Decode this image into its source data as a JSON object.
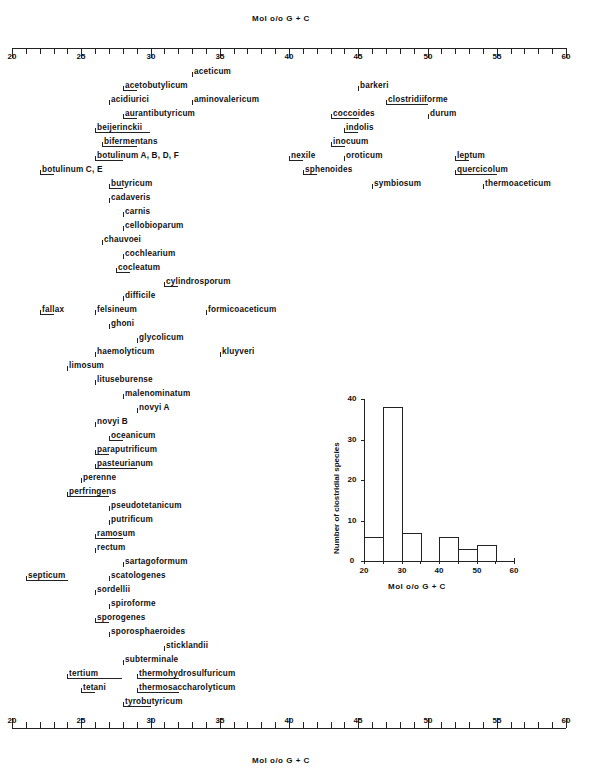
{
  "axis": {
    "title_top": "Mol o/o G + C",
    "title_bottom": "Mol o/o G + C",
    "min": 20,
    "max": 60,
    "major_ticks": [
      "20",
      "25",
      "30",
      "35",
      "40",
      "45",
      "50",
      "55",
      "60"
    ]
  },
  "chart_data": [
    {
      "type": "range",
      "title": "",
      "xlabel": "Mol % G + C",
      "xlim": [
        20,
        60
      ],
      "note": "Each species shown with start tick (and underline if range) of its G+C content",
      "species": [
        {
          "name": "aceticum",
          "min": 33,
          "max": 33
        },
        {
          "name": "acetobutylicum",
          "min": 28,
          "max": 29
        },
        {
          "name": "acidiurici",
          "min": 27,
          "max": 27
        },
        {
          "name": "aminovalericum",
          "min": 33,
          "max": 33
        },
        {
          "name": "aurantibutyricum",
          "min": 28,
          "max": 29
        },
        {
          "name": "beijerinckii",
          "min": 26,
          "max": 30
        },
        {
          "name": "bifermentans",
          "min": 26.5,
          "max": 29
        },
        {
          "name": "botulinum A,B,D,F",
          "min": 26,
          "max": 28
        },
        {
          "name": "botulinum C,E",
          "min": 22,
          "max": 23
        },
        {
          "name": "butyricum",
          "min": 27,
          "max": 28
        },
        {
          "name": "cadaveris",
          "min": 27,
          "max": 27
        },
        {
          "name": "carnis",
          "min": 28,
          "max": 28
        },
        {
          "name": "cellobioparum",
          "min": 28,
          "max": 28
        },
        {
          "name": "chauvoei",
          "min": 26.5,
          "max": 26.5
        },
        {
          "name": "cochlearium",
          "min": 28,
          "max": 28
        },
        {
          "name": "cocleatum",
          "min": 27.5,
          "max": 28.5
        },
        {
          "name": "cylindrosporum",
          "min": 31,
          "max": 32
        },
        {
          "name": "difficile",
          "min": 28,
          "max": 28
        },
        {
          "name": "fallax",
          "min": 22,
          "max": 23
        },
        {
          "name": "felsineum",
          "min": 26,
          "max": 26
        },
        {
          "name": "formicoaceticum",
          "min": 34,
          "max": 34
        },
        {
          "name": "ghoni",
          "min": 27,
          "max": 27
        },
        {
          "name": "glycolicum",
          "min": 29,
          "max": 29
        },
        {
          "name": "haemolyticum",
          "min": 26,
          "max": 26
        },
        {
          "name": "kluyveri",
          "min": 35,
          "max": 35
        },
        {
          "name": "limosum",
          "min": 24,
          "max": 24
        },
        {
          "name": "lituseburense",
          "min": 26,
          "max": 26
        },
        {
          "name": "malenominatum",
          "min": 28,
          "max": 28
        },
        {
          "name": "novyi A",
          "min": 29,
          "max": 29
        },
        {
          "name": "novyi B",
          "min": 26,
          "max": 26
        },
        {
          "name": "oceanicum",
          "min": 27,
          "max": 28
        },
        {
          "name": "paraputrificum",
          "min": 26,
          "max": 27
        },
        {
          "name": "pasteurianum",
          "min": 26,
          "max": 29
        },
        {
          "name": "perenne",
          "min": 25,
          "max": 25
        },
        {
          "name": "perfringens",
          "min": 24,
          "max": 27
        },
        {
          "name": "pseudotetanicum",
          "min": 27,
          "max": 27
        },
        {
          "name": "putrificum",
          "min": 27,
          "max": 27
        },
        {
          "name": "ramosum",
          "min": 26,
          "max": 28
        },
        {
          "name": "rectum",
          "min": 26,
          "max": 26
        },
        {
          "name": "sartagoformum",
          "min": 28,
          "max": 28
        },
        {
          "name": "septicum",
          "min": 21,
          "max": 24
        },
        {
          "name": "scatologenes",
          "min": 27,
          "max": 27
        },
        {
          "name": "sordellii",
          "min": 26,
          "max": 26
        },
        {
          "name": "spiroforme",
          "min": 27,
          "max": 27
        },
        {
          "name": "sporogenes",
          "min": 26,
          "max": 27
        },
        {
          "name": "sporosphaeroides",
          "min": 27,
          "max": 27
        },
        {
          "name": "sticklandii",
          "min": 31,
          "max": 31
        },
        {
          "name": "subterminale",
          "min": 28,
          "max": 28
        },
        {
          "name": "tertium",
          "min": 24,
          "max": 28
        },
        {
          "name": "tetani",
          "min": 25,
          "max": 26
        },
        {
          "name": "thermohydrosulfuricum",
          "min": 29,
          "max": 32
        },
        {
          "name": "thermosaccharolyticum",
          "min": 29,
          "max": 32
        },
        {
          "name": "tyrobutyricum",
          "min": 28,
          "max": 30
        },
        {
          "name": "barkeri",
          "min": 45,
          "max": 45
        },
        {
          "name": "clostridiiforme",
          "min": 47,
          "max": 50
        },
        {
          "name": "coccoides",
          "min": 43,
          "max": 45
        },
        {
          "name": "durum",
          "min": 50,
          "max": 50
        },
        {
          "name": "indolis",
          "min": 44,
          "max": 45
        },
        {
          "name": "inocuum",
          "min": 43,
          "max": 44
        },
        {
          "name": "nexile",
          "min": 40,
          "max": 41
        },
        {
          "name": "oroticum",
          "min": 44,
          "max": 44
        },
        {
          "name": "leptum",
          "min": 52,
          "max": 53
        },
        {
          "name": "quercicolum",
          "min": 52,
          "max": 55
        },
        {
          "name": "sphenoides",
          "min": 41,
          "max": 42
        },
        {
          "name": "symbiosum",
          "min": 46,
          "max": 46
        },
        {
          "name": "thermoaceticum",
          "min": 54,
          "max": 54
        }
      ]
    },
    {
      "type": "bar",
      "title": "",
      "xlabel": "Mol o/o G + C",
      "ylabel": "Number of clostridial species",
      "categories": [
        "20-25",
        "25-30",
        "30-35",
        "35-40",
        "40-45",
        "45-50",
        "50-55"
      ],
      "values": [
        6,
        38,
        7,
        0,
        6,
        3,
        4
      ],
      "xticks": [
        "20",
        "30",
        "40",
        "50",
        "60"
      ],
      "yticks": [
        "0",
        "10",
        "20",
        "30",
        "40"
      ],
      "xlim": [
        20,
        60
      ],
      "ylim": [
        0,
        40
      ],
      "grid": false
    }
  ],
  "species_layout": [
    {
      "name": "aceticum",
      "x": 33,
      "x2": 33,
      "y": 75
    },
    {
      "name": "acetobutylicum",
      "x": 28,
      "x2": 29,
      "y": 89
    },
    {
      "name": "acidiurici",
      "x": 27,
      "x2": 27,
      "y": 103
    },
    {
      "name": "aminovalericum",
      "x": 33,
      "x2": 33,
      "y": 103
    },
    {
      "name": "aurantibutyricum",
      "x": 28,
      "x2": 29,
      "y": 117
    },
    {
      "name": "beijerinckii",
      "x": 26,
      "x2": 30,
      "y": 131
    },
    {
      "name": "bifermentans",
      "x": 26.5,
      "x2": 29,
      "y": 145
    },
    {
      "name": "botulinum  A, B, D, F",
      "x": 26,
      "x2": 28,
      "y": 159
    },
    {
      "name": "botulinum C, E",
      "x": 22,
      "x2": 23,
      "y": 173
    },
    {
      "name": "butyricum",
      "x": 27,
      "x2": 28,
      "y": 187
    },
    {
      "name": "cadaveris",
      "x": 27,
      "x2": 27,
      "y": 201
    },
    {
      "name": "carnis",
      "x": 28,
      "x2": 28,
      "y": 215
    },
    {
      "name": "cellobioparum",
      "x": 28,
      "x2": 28,
      "y": 229
    },
    {
      "name": "chauvoei",
      "x": 26.5,
      "x2": 26.5,
      "y": 243
    },
    {
      "name": "cochlearium",
      "x": 28,
      "x2": 28,
      "y": 257
    },
    {
      "name": "cocleatum",
      "x": 27.5,
      "x2": 28.5,
      "y": 271
    },
    {
      "name": "cylindrosporum",
      "x": 31,
      "x2": 32,
      "y": 285
    },
    {
      "name": "difficile",
      "x": 28,
      "x2": 28,
      "y": 299
    },
    {
      "name": "fallax",
      "x": 22,
      "x2": 23,
      "y": 313
    },
    {
      "name": "felsineum",
      "x": 26,
      "x2": 26,
      "y": 313
    },
    {
      "name": "formicoaceticum",
      "x": 34,
      "x2": 34,
      "y": 313
    },
    {
      "name": "ghoni",
      "x": 27,
      "x2": 27,
      "y": 327
    },
    {
      "name": "glycolicum",
      "x": 29,
      "x2": 29,
      "y": 341
    },
    {
      "name": "haemolyticum",
      "x": 26,
      "x2": 26,
      "y": 355
    },
    {
      "name": "kluyveri",
      "x": 35,
      "x2": 35,
      "y": 355
    },
    {
      "name": "limosum",
      "x": 24,
      "x2": 24,
      "y": 369
    },
    {
      "name": "lituseburense",
      "x": 26,
      "x2": 26,
      "y": 383
    },
    {
      "name": "malenominatum",
      "x": 28,
      "x2": 28,
      "y": 397
    },
    {
      "name": "novyi  A",
      "x": 29,
      "x2": 29,
      "y": 411
    },
    {
      "name": "novyi  B",
      "x": 26,
      "x2": 26,
      "y": 425
    },
    {
      "name": "oceanicum",
      "x": 27,
      "x2": 28,
      "y": 439
    },
    {
      "name": "paraputrificum",
      "x": 26,
      "x2": 27,
      "y": 453
    },
    {
      "name": "pasteurianum",
      "x": 26,
      "x2": 29,
      "y": 467
    },
    {
      "name": "perenne",
      "x": 25,
      "x2": 25,
      "y": 481
    },
    {
      "name": "perfringens",
      "x": 24,
      "x2": 27,
      "y": 495
    },
    {
      "name": "pseudotetanicum",
      "x": 27,
      "x2": 27,
      "y": 509
    },
    {
      "name": "putrificum",
      "x": 27,
      "x2": 27,
      "y": 523
    },
    {
      "name": "ramosum",
      "x": 26,
      "x2": 28,
      "y": 537
    },
    {
      "name": "rectum",
      "x": 26,
      "x2": 26,
      "y": 551
    },
    {
      "name": "sartagoformum",
      "x": 28,
      "x2": 28,
      "y": 565
    },
    {
      "name": "septicum",
      "x": 21,
      "x2": 24,
      "y": 579
    },
    {
      "name": "scatologenes",
      "x": 27,
      "x2": 27,
      "y": 579
    },
    {
      "name": "sordellii",
      "x": 26,
      "x2": 26,
      "y": 593
    },
    {
      "name": "spiroforme",
      "x": 27,
      "x2": 27,
      "y": 607
    },
    {
      "name": "sporogenes",
      "x": 26,
      "x2": 27,
      "y": 621
    },
    {
      "name": "sporosphaeroides",
      "x": 27,
      "x2": 27,
      "y": 635
    },
    {
      "name": "sticklandii",
      "x": 31,
      "x2": 31,
      "y": 649
    },
    {
      "name": "subterminale",
      "x": 28,
      "x2": 28,
      "y": 663
    },
    {
      "name": "tertium",
      "x": 24,
      "x2": 28,
      "y": 677
    },
    {
      "name": "thermohydrosulfuricum",
      "x": 29,
      "x2": 32,
      "y": 677
    },
    {
      "name": "tetani",
      "x": 25,
      "x2": 26,
      "y": 691
    },
    {
      "name": "thermosaccharolyticum",
      "x": 29,
      "x2": 32,
      "y": 691
    },
    {
      "name": "tyrobutyricum",
      "x": 28,
      "x2": 30,
      "y": 705
    },
    {
      "name": "barkeri",
      "x": 45,
      "x2": 45,
      "y": 89
    },
    {
      "name": "clostridiiforme",
      "x": 47,
      "x2": 50,
      "y": 103
    },
    {
      "name": "coccoides",
      "x": 43,
      "x2": 45,
      "y": 117
    },
    {
      "name": "durum",
      "x": 50,
      "x2": 50,
      "y": 117
    },
    {
      "name": "indolis",
      "x": 44,
      "x2": 45,
      "y": 131
    },
    {
      "name": "inocuum",
      "x": 43,
      "x2": 44,
      "y": 145
    },
    {
      "name": "nexile",
      "x": 40,
      "x2": 41,
      "y": 159
    },
    {
      "name": "oroticum",
      "x": 44,
      "x2": 44,
      "y": 159
    },
    {
      "name": "leptum",
      "x": 52,
      "x2": 53,
      "y": 159
    },
    {
      "name": "sphenoides",
      "x": 41,
      "x2": 42,
      "y": 173
    },
    {
      "name": "quercicolum",
      "x": 52,
      "x2": 55,
      "y": 173
    },
    {
      "name": "symbiosum",
      "x": 46,
      "x2": 46,
      "y": 187
    },
    {
      "name": "thermoaceticum",
      "x": 54,
      "x2": 54,
      "y": 187
    }
  ],
  "histogram": {
    "ylabel": "Number of clostridial species",
    "xlabel": "Mol o/o G + C",
    "yticks": [
      "0",
      "10",
      "20",
      "30",
      "40"
    ],
    "xticks": [
      "20",
      "30",
      "40",
      "50",
      "60"
    ],
    "bars": [
      {
        "from": 20,
        "to": 25,
        "count": 6
      },
      {
        "from": 25,
        "to": 30,
        "count": 38
      },
      {
        "from": 30,
        "to": 35,
        "count": 7
      },
      {
        "from": 40,
        "to": 45,
        "count": 6
      },
      {
        "from": 45,
        "to": 50,
        "count": 3
      },
      {
        "from": 50,
        "to": 55,
        "count": 4
      }
    ]
  }
}
